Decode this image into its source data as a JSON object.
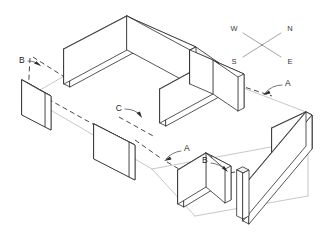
{
  "drawing": {
    "title": "Isometric partition wall layout",
    "background_color": "#ffffff",
    "line_color": "#2b2b2b",
    "dashed_grid_color": "#333333",
    "floor_line_color": "#b9b9b9",
    "wall_top_fill": "#f2f2f2",
    "wall_end_fill": "#e4e4e4"
  },
  "compass": {
    "name": "compass-rose",
    "labels": {
      "west": "W",
      "north": "N",
      "south": "S",
      "east": "E"
    }
  },
  "callouts": [
    {
      "id": "callout-b-upper-left",
      "label": "B"
    },
    {
      "id": "callout-c-center",
      "label": "C"
    },
    {
      "id": "callout-a-right",
      "label": "A"
    },
    {
      "id": "callout-a-lower-center",
      "label": "A"
    },
    {
      "id": "callout-b-lower-center",
      "label": "B"
    }
  ],
  "walls": [
    {
      "id": "wall-back-left-long",
      "group": "back-corner"
    },
    {
      "id": "wall-back-right-return",
      "group": "back-corner"
    },
    {
      "id": "wall-left-standalone",
      "group": "left-side"
    },
    {
      "id": "wall-front-left-standalone",
      "group": "front-left"
    },
    {
      "id": "wall-center-long",
      "group": "center-cross"
    },
    {
      "id": "wall-center-return",
      "group": "center-cross"
    },
    {
      "id": "wall-center-stub",
      "group": "center-cross"
    },
    {
      "id": "wall-right-corner-long",
      "group": "right-corner"
    },
    {
      "id": "wall-right-corner-return",
      "group": "right-corner"
    },
    {
      "id": "wall-front-corner-panel",
      "group": "front-corner"
    },
    {
      "id": "wall-front-right-panel",
      "group": "front-right"
    }
  ]
}
